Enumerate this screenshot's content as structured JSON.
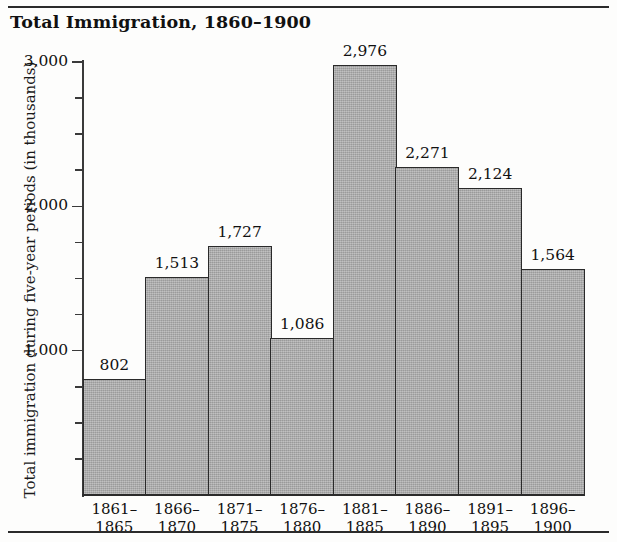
{
  "chart_data": {
    "type": "bar",
    "title": "Total Immigration, 1860–1900",
    "xlabel": "",
    "ylabel": "Total immigration during five-year periods (in thousands)",
    "categories": [
      "1861–1865",
      "1866–1870",
      "1871–1875",
      "1876–1880",
      "1881–1885",
      "1886–1890",
      "1891–1895",
      "1896–1900"
    ],
    "category_lines": [
      [
        "1861–",
        "1865"
      ],
      [
        "1866–",
        "1870"
      ],
      [
        "1871–",
        "1875"
      ],
      [
        "1876–",
        "1880"
      ],
      [
        "1881–",
        "1885"
      ],
      [
        "1886–",
        "1890"
      ],
      [
        "1891–",
        "1895"
      ],
      [
        "1896–",
        "1900"
      ]
    ],
    "values": [
      802,
      1513,
      1727,
      1086,
      2976,
      2271,
      2124,
      1564
    ],
    "value_labels": [
      "802",
      "1,513",
      "1,727",
      "1,086",
      "2,976",
      "2,271",
      "2,124",
      "1,564"
    ],
    "ylim": [
      0,
      3000
    ],
    "ytick_major": [
      1000,
      2000,
      3000
    ],
    "ytick_major_labels": [
      "1,000",
      "2,000",
      "3,000"
    ],
    "ytick_minor_step": 250,
    "grid": false,
    "legend": false,
    "bar_fill_color": "#a9a9a9",
    "bar_border_color": "#2a2a2a",
    "axis_color": "#2b2b2b",
    "text_color": "#111111"
  }
}
